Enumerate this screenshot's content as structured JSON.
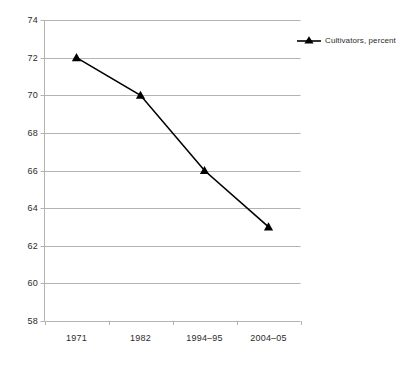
{
  "chart_data": {
    "type": "line",
    "title": "",
    "xlabel": "",
    "ylabel": "",
    "categories": [
      "1971",
      "1982",
      "1994–95",
      "2004–05"
    ],
    "series": [
      {
        "name": "Cultivators, percent",
        "values": [
          72,
          70,
          66,
          63
        ],
        "color": "#000000",
        "marker": "triangle-up",
        "marker_filled": true
      }
    ],
    "ylim": [
      58,
      74
    ],
    "yticks": [
      58,
      60,
      62,
      64,
      66,
      68,
      70,
      72,
      74
    ],
    "ytick_labels": [
      "58",
      "60",
      "62",
      "64",
      "66",
      "68",
      "70",
      "72",
      "74"
    ],
    "grid": true,
    "grid_axis": "y",
    "grid_color": "#b3b3b3",
    "axis_color": "#b3b3b3",
    "legend_position": "right",
    "plot_background": "#ffffff"
  },
  "legend": {
    "entries": [
      {
        "label": "Cultivators, percent",
        "marker_icon": "triangle-up-marker"
      }
    ]
  },
  "axes": {
    "y_tick_labels": [
      "74",
      "72",
      "70",
      "68",
      "66",
      "64",
      "62",
      "60",
      "58"
    ],
    "x_tick_labels": [
      "1971",
      "1982",
      "1994–95",
      "2004–05"
    ]
  }
}
